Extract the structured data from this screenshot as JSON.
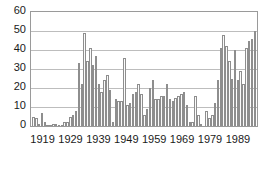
{
  "chart_data": {
    "type": "bar",
    "title": "",
    "subtitle": "",
    "xlabel": "",
    "ylabel": "",
    "xlim": [
      1915,
      1995
    ],
    "ylim": [
      0,
      60
    ],
    "yticks": [
      0,
      10,
      20,
      30,
      40,
      50,
      60
    ],
    "xticks": [
      1919,
      1929,
      1939,
      1949,
      1959,
      1969,
      1979,
      1989
    ],
    "xtick_labels": [
      "1919",
      "1929",
      "1939",
      "1949",
      "1959",
      "1969",
      "1979",
      "1989"
    ],
    "grid": "horizontal",
    "legend": "none",
    "bar_fill_color": "#fbfbfb",
    "bar_edge_color": "#8e8e8e",
    "axis_color": "#9a9a9a",
    "gridline_color": "#bdbdbd",
    "text_color": "#1a1a1a",
    "background_color": "#ffffff",
    "categories": [
      "1915",
      "1916",
      "1917",
      "1918",
      "1919",
      "1920",
      "1921",
      "1922",
      "1923",
      "1924",
      "1925",
      "1926",
      "1927",
      "1928",
      "1929",
      "1930",
      "1931",
      "1932",
      "1933",
      "1934",
      "1935",
      "1936",
      "1937",
      "1938",
      "1939",
      "1940",
      "1941",
      "1942",
      "1943",
      "1944",
      "1945",
      "1946",
      "1947",
      "1948",
      "1949",
      "1950",
      "1951",
      "1952",
      "1953",
      "1954",
      "1955",
      "1956",
      "1957",
      "1958",
      "1959",
      "1960",
      "1961",
      "1962",
      "1963",
      "1964",
      "1965",
      "1966",
      "1967",
      "1968",
      "1969",
      "1970",
      "1971",
      "1972",
      "1973",
      "1974",
      "1975",
      "1976",
      "1977",
      "1978",
      "1979",
      "1980",
      "1981",
      "1982",
      "1983",
      "1984",
      "1985",
      "1986",
      "1987",
      "1988",
      "1989",
      "1990",
      "1991",
      "1992",
      "1993",
      "1994",
      "1995"
    ],
    "values": [
      5,
      4,
      1,
      7,
      2,
      0.5,
      0.5,
      1,
      1,
      0.5,
      0.5,
      2,
      2,
      5,
      6,
      8,
      33,
      22,
      49,
      34,
      41,
      32,
      37,
      22,
      18,
      24,
      27,
      19,
      2,
      14,
      13,
      13,
      36,
      11,
      12,
      17,
      18,
      22,
      17,
      6,
      9,
      20,
      24,
      14,
      14,
      16,
      16,
      22,
      14,
      13,
      15,
      16,
      17,
      18,
      11,
      2,
      2,
      16,
      6,
      1,
      0,
      0,
      0,
      8,
      4,
      6,
      12,
      24,
      41,
      48,
      42,
      34,
      25,
      40,
      24,
      29,
      22,
      41,
      45,
      46,
      50
    ]
  }
}
